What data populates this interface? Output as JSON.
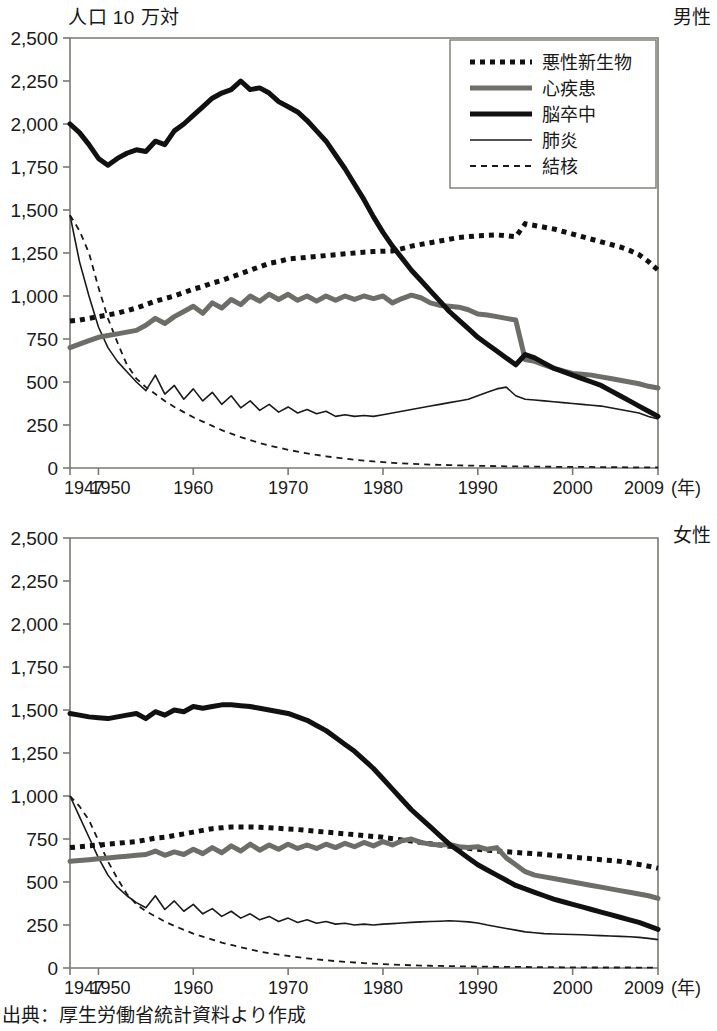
{
  "unit_label": "人口 10 万対",
  "source_note": "出典：厚生労働省統計資料より作成",
  "x_axis_unit": "(年)",
  "panels": [
    {
      "id": "male",
      "title": "男性"
    },
    {
      "id": "female",
      "title": "女性"
    }
  ],
  "legend": {
    "items": [
      {
        "key": "cancer",
        "label": "悪性新生物",
        "style": "thick-dotted",
        "color": "#111111"
      },
      {
        "key": "heart",
        "label": "心疾患",
        "style": "thick-gray",
        "color": "#6e6e68"
      },
      {
        "key": "stroke",
        "label": "脳卒中",
        "style": "thick-solid",
        "color": "#111111"
      },
      {
        "key": "pneumonia",
        "label": "肺炎",
        "style": "thin-solid",
        "color": "#1a1a1a"
      },
      {
        "key": "tb",
        "label": "結核",
        "style": "thin-dashed",
        "color": "#1a1a1a"
      }
    ]
  },
  "y_ticks": [
    "2,500",
    "2,250",
    "2,000",
    "1,750",
    "1,500",
    "1,250",
    "1,000",
    "750",
    "500",
    "250",
    "0"
  ],
  "x_ticks": [
    {
      "label": "1947",
      "year": 1947
    },
    {
      "label": "1950",
      "year": 1950
    },
    {
      "label": "1960",
      "year": 1960
    },
    {
      "label": "1970",
      "year": 1970
    },
    {
      "label": "1980",
      "year": 1980
    },
    {
      "label": "1990",
      "year": 1990
    },
    {
      "label": "2000",
      "year": 2000
    },
    {
      "label": "2009",
      "year": 2009
    }
  ],
  "chart_data": [
    {
      "type": "line",
      "title": "男性",
      "subtitle": "",
      "xlabel": "(年)",
      "ylabel": "人口 10 万対",
      "ylim": [
        0,
        2500
      ],
      "xlim": [
        1947,
        2009
      ],
      "ytick_step": 250,
      "grid": false,
      "legend_position": "top-right",
      "x": [
        1947,
        1948,
        1949,
        1950,
        1951,
        1952,
        1953,
        1954,
        1955,
        1956,
        1957,
        1958,
        1959,
        1960,
        1961,
        1962,
        1963,
        1964,
        1965,
        1966,
        1967,
        1968,
        1969,
        1970,
        1971,
        1972,
        1973,
        1974,
        1975,
        1976,
        1977,
        1978,
        1979,
        1980,
        1981,
        1982,
        1983,
        1984,
        1985,
        1986,
        1987,
        1988,
        1989,
        1990,
        1991,
        1992,
        1993,
        1994,
        1995,
        1996,
        1997,
        1998,
        1999,
        2000,
        2001,
        2002,
        2003,
        2004,
        2005,
        2006,
        2007,
        2008,
        2009
      ],
      "series": [
        {
          "name": "悪性新生物",
          "key": "cancer",
          "values": [
            855,
            860,
            870,
            880,
            890,
            900,
            915,
            930,
            950,
            970,
            985,
            1000,
            1020,
            1040,
            1055,
            1075,
            1090,
            1110,
            1130,
            1150,
            1170,
            1190,
            1200,
            1215,
            1220,
            1225,
            1230,
            1235,
            1240,
            1245,
            1250,
            1255,
            1258,
            1260,
            1262,
            1275,
            1290,
            1300,
            1310,
            1320,
            1330,
            1340,
            1345,
            1350,
            1352,
            1355,
            1350,
            1345,
            1420,
            1410,
            1400,
            1390,
            1375,
            1360,
            1345,
            1330,
            1315,
            1300,
            1285,
            1265,
            1240,
            1200,
            1150
          ]
        },
        {
          "name": "心疾患",
          "key": "heart",
          "values": [
            700,
            720,
            740,
            760,
            770,
            780,
            790,
            800,
            830,
            870,
            840,
            880,
            910,
            940,
            900,
            960,
            930,
            980,
            950,
            1000,
            970,
            1010,
            980,
            1010,
            975,
            1000,
            970,
            1000,
            975,
            1000,
            980,
            1000,
            985,
            1000,
            960,
            985,
            1005,
            990,
            960,
            945,
            940,
            935,
            920,
            895,
            890,
            880,
            870,
            860,
            630,
            620,
            600,
            580,
            565,
            550,
            545,
            540,
            530,
            520,
            510,
            500,
            490,
            475,
            465
          ]
        },
        {
          "name": "脳卒中",
          "key": "stroke",
          "values": [
            2000,
            1950,
            1880,
            1800,
            1760,
            1800,
            1830,
            1850,
            1840,
            1900,
            1880,
            1960,
            2000,
            2050,
            2100,
            2150,
            2180,
            2200,
            2250,
            2200,
            2210,
            2180,
            2130,
            2100,
            2070,
            2020,
            1960,
            1900,
            1820,
            1740,
            1650,
            1560,
            1460,
            1370,
            1290,
            1220,
            1150,
            1090,
            1030,
            970,
            910,
            860,
            810,
            760,
            720,
            680,
            640,
            600,
            660,
            640,
            610,
            580,
            560,
            540,
            520,
            500,
            480,
            450,
            420,
            390,
            360,
            330,
            300
          ]
        },
        {
          "name": "肺炎",
          "key": "pneumonia",
          "values": [
            1470,
            1200,
            1000,
            820,
            700,
            620,
            560,
            500,
            450,
            540,
            430,
            480,
            400,
            460,
            390,
            440,
            370,
            420,
            350,
            390,
            335,
            370,
            325,
            355,
            320,
            340,
            315,
            330,
            300,
            310,
            300,
            305,
            300,
            310,
            320,
            330,
            340,
            350,
            360,
            370,
            380,
            390,
            400,
            420,
            440,
            460,
            470,
            420,
            400,
            395,
            390,
            385,
            380,
            375,
            370,
            365,
            360,
            350,
            340,
            330,
            320,
            300,
            285
          ]
        },
        {
          "name": "結核",
          "key": "tb",
          "values": [
            1470,
            1380,
            1250,
            1050,
            870,
            730,
            600,
            520,
            470,
            430,
            390,
            355,
            325,
            295,
            270,
            245,
            220,
            200,
            180,
            162,
            145,
            130,
            118,
            106,
            95,
            85,
            76,
            68,
            61,
            54,
            48,
            43,
            38,
            34,
            30,
            27,
            24,
            22,
            20,
            18,
            17,
            15,
            14,
            13,
            12,
            11,
            10,
            9,
            9,
            8,
            8,
            7,
            7,
            6,
            6,
            6,
            5,
            5,
            5,
            4,
            4,
            4,
            3
          ]
        }
      ]
    },
    {
      "type": "line",
      "title": "女性",
      "subtitle": "",
      "xlabel": "(年)",
      "ylabel": "人口 10 万対",
      "ylim": [
        0,
        2500
      ],
      "xlim": [
        1947,
        2009
      ],
      "ytick_step": 250,
      "grid": false,
      "legend_position": "none",
      "x": [
        1947,
        1948,
        1949,
        1950,
        1951,
        1952,
        1953,
        1954,
        1955,
        1956,
        1957,
        1958,
        1959,
        1960,
        1961,
        1962,
        1963,
        1964,
        1965,
        1966,
        1967,
        1968,
        1969,
        1970,
        1971,
        1972,
        1973,
        1974,
        1975,
        1976,
        1977,
        1978,
        1979,
        1980,
        1981,
        1982,
        1983,
        1984,
        1985,
        1986,
        1987,
        1988,
        1989,
        1990,
        1991,
        1992,
        1993,
        1994,
        1995,
        1996,
        1997,
        1998,
        1999,
        2000,
        2001,
        2002,
        2003,
        2004,
        2005,
        2006,
        2007,
        2008,
        2009
      ],
      "series": [
        {
          "name": "悪性新生物",
          "key": "cancer",
          "values": [
            700,
            705,
            710,
            715,
            720,
            725,
            730,
            735,
            745,
            755,
            760,
            770,
            780,
            790,
            800,
            810,
            815,
            820,
            820,
            820,
            818,
            815,
            812,
            808,
            805,
            800,
            795,
            790,
            785,
            780,
            775,
            770,
            765,
            760,
            752,
            745,
            738,
            730,
            722,
            715,
            708,
            702,
            696,
            690,
            685,
            680,
            676,
            672,
            668,
            664,
            660,
            655,
            650,
            645,
            640,
            635,
            630,
            625,
            620,
            612,
            602,
            592,
            580
          ]
        },
        {
          "name": "心疾患",
          "key": "heart",
          "values": [
            620,
            625,
            630,
            635,
            640,
            645,
            650,
            655,
            660,
            680,
            655,
            675,
            660,
            690,
            665,
            700,
            670,
            710,
            680,
            720,
            685,
            715,
            690,
            720,
            695,
            715,
            695,
            720,
            700,
            725,
            705,
            730,
            710,
            735,
            715,
            740,
            750,
            730,
            720,
            715,
            718,
            705,
            700,
            705,
            690,
            700,
            640,
            600,
            560,
            540,
            530,
            520,
            510,
            500,
            490,
            480,
            470,
            460,
            450,
            440,
            430,
            420,
            405
          ]
        },
        {
          "name": "脳卒中",
          "key": "stroke",
          "values": [
            1480,
            1470,
            1460,
            1455,
            1450,
            1460,
            1470,
            1480,
            1450,
            1490,
            1470,
            1500,
            1490,
            1520,
            1510,
            1520,
            1530,
            1530,
            1525,
            1520,
            1510,
            1500,
            1490,
            1480,
            1460,
            1440,
            1410,
            1380,
            1340,
            1300,
            1260,
            1210,
            1160,
            1100,
            1040,
            980,
            920,
            870,
            820,
            770,
            720,
            680,
            640,
            600,
            570,
            540,
            510,
            480,
            460,
            440,
            420,
            400,
            385,
            370,
            355,
            340,
            325,
            310,
            295,
            280,
            265,
            245,
            225
          ]
        },
        {
          "name": "肺炎",
          "key": "pneumonia",
          "values": [
            1000,
            880,
            760,
            640,
            540,
            470,
            420,
            380,
            350,
            420,
            340,
            390,
            330,
            370,
            315,
            345,
            300,
            330,
            290,
            315,
            280,
            300,
            270,
            290,
            265,
            280,
            260,
            270,
            255,
            260,
            250,
            255,
            250,
            255,
            258,
            262,
            265,
            268,
            270,
            272,
            275,
            272,
            268,
            262,
            250,
            240,
            230,
            220,
            210,
            205,
            200,
            198,
            196,
            195,
            193,
            190,
            188,
            186,
            184,
            182,
            178,
            172,
            165
          ]
        },
        {
          "name": "結核",
          "key": "tb",
          "values": [
            1000,
            940,
            860,
            740,
            620,
            520,
            430,
            370,
            330,
            300,
            270,
            245,
            222,
            200,
            182,
            165,
            148,
            134,
            120,
            108,
            96,
            86,
            78,
            70,
            63,
            56,
            50,
            45,
            40,
            36,
            32,
            28,
            25,
            22,
            20,
            18,
            16,
            14,
            13,
            12,
            11,
            10,
            9,
            8,
            8,
            7,
            7,
            6,
            6,
            5,
            5,
            5,
            4,
            4,
            4,
            3,
            3,
            3,
            3,
            3,
            2,
            2,
            2
          ]
        }
      ]
    }
  ]
}
